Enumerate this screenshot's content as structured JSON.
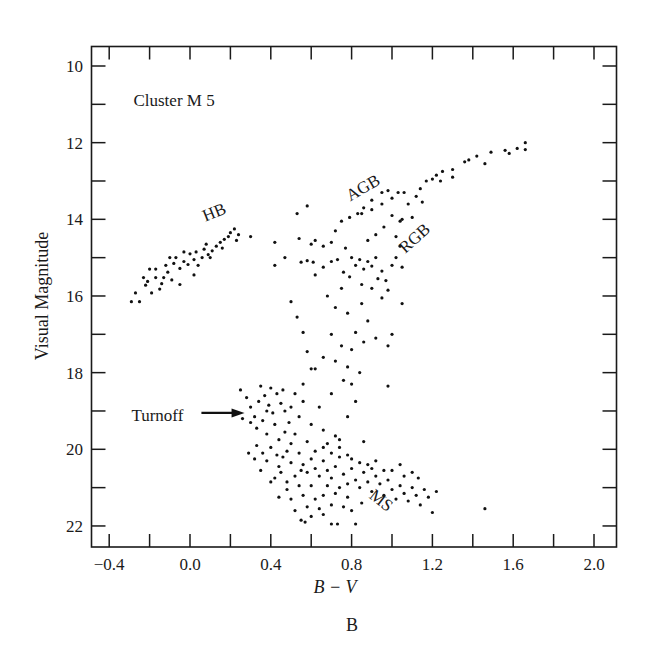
{
  "figure_label": "B",
  "chart_data": {
    "type": "scatter",
    "title": "Cluster M 5",
    "xlabel": "B − V",
    "ylabel": "Visual Magnitude",
    "xlim": [
      -0.48,
      2.11
    ],
    "ylim": [
      22.5,
      9.5
    ],
    "y_inverted": true,
    "grid": false,
    "legend": null,
    "x_ticks": [
      -0.4,
      0.0,
      0.4,
      0.8,
      1.2,
      1.6,
      2.0
    ],
    "x_tick_labels": [
      "−0.4",
      "0.0",
      "0.4",
      "0.8",
      "1.2",
      "1.6",
      "2.0"
    ],
    "x_minor_ticks": [
      -0.2,
      0.2,
      0.6,
      1.0,
      1.4,
      1.8
    ],
    "y_ticks": [
      10,
      12,
      14,
      16,
      18,
      20,
      22
    ],
    "y_tick_labels": [
      "10",
      "12",
      "14",
      "16",
      "18",
      "20",
      "22"
    ],
    "y_minor_ticks": [
      11,
      13,
      15,
      17,
      19,
      21
    ],
    "annotations": [
      {
        "text": "Cluster M 5",
        "bv": -0.28,
        "v": 11.05,
        "rotate": 0
      },
      {
        "text": "HB",
        "bv": 0.13,
        "v": 13.95,
        "rotate": -22
      },
      {
        "text": "AGB",
        "bv": 0.87,
        "v": 13.3,
        "rotate": -30
      },
      {
        "text": "RGB",
        "bv": 1.13,
        "v": 14.6,
        "rotate": -42
      },
      {
        "text": "MS",
        "bv": 0.93,
        "v": 21.45,
        "rotate": 38
      },
      {
        "text": "Turnoff",
        "bv": -0.29,
        "v": 19.25,
        "rotate": 0,
        "arrow_to": {
          "bv": 0.27,
          "v": 19.05
        }
      }
    ],
    "series": [
      {
        "name": "Horizontal Branch (HB)",
        "points": [
          [
            -0.29,
            16.15
          ],
          [
            -0.25,
            16.15
          ],
          [
            -0.27,
            15.92
          ],
          [
            -0.22,
            15.72
          ],
          [
            -0.19,
            15.92
          ],
          [
            -0.21,
            15.62
          ],
          [
            -0.23,
            15.52
          ],
          [
            -0.17,
            15.52
          ],
          [
            -0.15,
            15.82
          ],
          [
            -0.17,
            15.3
          ],
          [
            -0.2,
            15.3
          ],
          [
            -0.13,
            15.52
          ],
          [
            -0.11,
            15.38
          ],
          [
            -0.09,
            15.58
          ],
          [
            -0.12,
            15.2
          ],
          [
            -0.08,
            15.15
          ],
          [
            -0.05,
            15.28
          ],
          [
            -0.07,
            15.0
          ],
          [
            -0.03,
            15.1
          ],
          [
            -0.01,
            15.18
          ],
          [
            0.0,
            14.9
          ],
          [
            0.02,
            15.05
          ],
          [
            0.04,
            15.2
          ],
          [
            0.03,
            14.85
          ],
          [
            -0.03,
            14.85
          ],
          [
            0.06,
            15.0
          ],
          [
            0.07,
            14.78
          ],
          [
            0.09,
            14.92
          ],
          [
            0.11,
            14.82
          ],
          [
            0.13,
            14.7
          ],
          [
            0.15,
            14.6
          ],
          [
            0.17,
            14.52
          ],
          [
            0.19,
            14.45
          ],
          [
            0.2,
            14.35
          ],
          [
            0.22,
            14.25
          ],
          [
            0.24,
            14.4
          ],
          [
            0.23,
            14.55
          ],
          [
            0.1,
            15.0
          ],
          [
            -0.05,
            15.7
          ],
          [
            0.02,
            15.45
          ],
          [
            0.08,
            14.65
          ],
          [
            0.3,
            14.45
          ],
          [
            0.16,
            14.75
          ],
          [
            -0.1,
            15.0
          ],
          [
            -0.14,
            15.68
          ]
        ]
      },
      {
        "name": "Red Giant Branch (RGB)",
        "points": [
          [
            0.55,
            15.12
          ],
          [
            0.58,
            15.08
          ],
          [
            0.61,
            15.12
          ],
          [
            0.6,
            14.65
          ],
          [
            0.62,
            15.45
          ],
          [
            0.66,
            15.25
          ],
          [
            0.7,
            15.1
          ],
          [
            0.73,
            15.05
          ],
          [
            0.76,
            15.38
          ],
          [
            0.79,
            15.5
          ],
          [
            0.8,
            15.0
          ],
          [
            0.82,
            15.2
          ],
          [
            0.84,
            15.05
          ],
          [
            0.86,
            15.3
          ],
          [
            0.88,
            15.1
          ],
          [
            0.9,
            15.22
          ],
          [
            0.92,
            15.0
          ],
          [
            0.95,
            15.35
          ],
          [
            0.93,
            15.55
          ],
          [
            0.97,
            15.6
          ],
          [
            1.0,
            15.2
          ],
          [
            1.02,
            15.0
          ],
          [
            1.04,
            14.7
          ],
          [
            1.05,
            15.25
          ],
          [
            0.85,
            15.7
          ],
          [
            0.9,
            15.8
          ],
          [
            0.98,
            15.85
          ],
          [
            1.05,
            16.2
          ],
          [
            0.75,
            15.8
          ],
          [
            0.68,
            16.0
          ],
          [
            0.72,
            16.3
          ],
          [
            0.78,
            16.45
          ],
          [
            0.85,
            16.2
          ],
          [
            0.95,
            16.05
          ],
          [
            0.88,
            16.65
          ],
          [
            0.82,
            16.95
          ],
          [
            0.92,
            17.1
          ],
          [
            0.98,
            17.3
          ],
          [
            1.0,
            17.0
          ],
          [
            0.7,
            17.0
          ],
          [
            0.75,
            17.3
          ],
          [
            0.8,
            17.4
          ],
          [
            0.86,
            17.2
          ],
          [
            0.66,
            17.6
          ],
          [
            0.72,
            17.7
          ],
          [
            0.62,
            17.9
          ],
          [
            0.78,
            17.85
          ],
          [
            0.84,
            18.0
          ],
          [
            0.98,
            18.35
          ],
          [
            0.8,
            18.3
          ],
          [
            0.85,
            13.85
          ],
          [
            0.9,
            13.75
          ],
          [
            0.95,
            13.6
          ],
          [
            1.0,
            13.45
          ],
          [
            1.03,
            13.3
          ],
          [
            1.06,
            13.3
          ],
          [
            1.0,
            13.9
          ],
          [
            1.05,
            14.0
          ],
          [
            1.08,
            13.6
          ],
          [
            1.12,
            13.4
          ],
          [
            1.14,
            13.2
          ],
          [
            1.17,
            13.0
          ],
          [
            1.2,
            12.95
          ],
          [
            1.22,
            12.85
          ],
          [
            1.25,
            12.75
          ],
          [
            1.3,
            12.7
          ],
          [
            1.36,
            12.5
          ],
          [
            1.42,
            12.35
          ],
          [
            1.49,
            12.25
          ],
          [
            1.56,
            12.2
          ],
          [
            1.62,
            12.15
          ],
          [
            1.66,
            12.0
          ],
          [
            1.66,
            12.18
          ],
          [
            1.58,
            12.28
          ],
          [
            1.46,
            12.55
          ],
          [
            1.38,
            12.45
          ],
          [
            1.3,
            12.9
          ],
          [
            1.24,
            13.0
          ],
          [
            1.15,
            13.55
          ],
          [
            1.1,
            13.95
          ],
          [
            1.04,
            14.05
          ],
          [
            0.96,
            14.2
          ],
          [
            0.92,
            14.4
          ],
          [
            0.88,
            14.55
          ],
          [
            1.02,
            14.45
          ]
        ]
      },
      {
        "name": "Asymptotic Giant Branch (AGB)",
        "points": [
          [
            0.58,
            13.65
          ],
          [
            0.72,
            14.3
          ],
          [
            0.75,
            14.05
          ],
          [
            0.79,
            13.95
          ],
          [
            0.83,
            13.85
          ],
          [
            0.86,
            13.7
          ],
          [
            0.9,
            13.5
          ],
          [
            0.95,
            13.3
          ],
          [
            0.98,
            13.25
          ],
          [
            0.62,
            14.55
          ],
          [
            0.66,
            14.7
          ],
          [
            0.7,
            14.6
          ],
          [
            0.77,
            14.75
          ],
          [
            0.53,
            13.85
          ],
          [
            0.54,
            14.5
          ],
          [
            0.42,
            14.6
          ],
          [
            0.47,
            15.0
          ],
          [
            0.42,
            15.2
          ]
        ]
      },
      {
        "name": "Subgiant / Turnoff region",
        "points": [
          [
            0.5,
            16.15
          ],
          [
            0.53,
            16.55
          ],
          [
            0.56,
            16.95
          ],
          [
            0.58,
            17.45
          ],
          [
            0.6,
            17.9
          ],
          [
            0.56,
            18.3
          ],
          [
            0.52,
            18.55
          ],
          [
            0.5,
            18.9
          ],
          [
            0.54,
            19.15
          ],
          [
            0.6,
            19.35
          ],
          [
            0.66,
            19.5
          ],
          [
            0.72,
            19.65
          ],
          [
            0.64,
            18.9
          ],
          [
            0.7,
            18.55
          ],
          [
            0.76,
            18.2
          ],
          [
            0.82,
            18.75
          ],
          [
            0.78,
            19.15
          ],
          [
            0.68,
            19.85
          ],
          [
            0.74,
            19.95
          ]
        ]
      },
      {
        "name": "Turnoff / Main Sequence (MS)",
        "points": [
          [
            0.25,
            18.45
          ],
          [
            0.28,
            18.65
          ],
          [
            0.3,
            18.9
          ],
          [
            0.32,
            19.15
          ],
          [
            0.35,
            18.35
          ],
          [
            0.37,
            18.6
          ],
          [
            0.39,
            18.85
          ],
          [
            0.41,
            19.05
          ],
          [
            0.4,
            18.4
          ],
          [
            0.43,
            18.55
          ],
          [
            0.45,
            18.8
          ],
          [
            0.47,
            19.0
          ],
          [
            0.3,
            19.3
          ],
          [
            0.33,
            19.45
          ],
          [
            0.36,
            19.25
          ],
          [
            0.38,
            19.6
          ],
          [
            0.42,
            19.35
          ],
          [
            0.44,
            19.75
          ],
          [
            0.47,
            19.55
          ],
          [
            0.49,
            19.3
          ],
          [
            0.5,
            19.85
          ],
          [
            0.52,
            19.6
          ],
          [
            0.33,
            19.9
          ],
          [
            0.36,
            20.1
          ],
          [
            0.4,
            19.95
          ],
          [
            0.43,
            20.15
          ],
          [
            0.46,
            20.2
          ],
          [
            0.48,
            20.05
          ],
          [
            0.32,
            20.25
          ],
          [
            0.38,
            20.3
          ],
          [
            0.44,
            20.45
          ],
          [
            0.5,
            20.35
          ],
          [
            0.54,
            20.1
          ],
          [
            0.56,
            20.4
          ],
          [
            0.58,
            20.6
          ],
          [
            0.6,
            20.25
          ],
          [
            0.62,
            20.5
          ],
          [
            0.64,
            20.7
          ],
          [
            0.66,
            20.3
          ],
          [
            0.68,
            20.55
          ],
          [
            0.7,
            20.75
          ],
          [
            0.72,
            20.45
          ],
          [
            0.74,
            20.2
          ],
          [
            0.76,
            20.65
          ],
          [
            0.78,
            20.9
          ],
          [
            0.8,
            20.5
          ],
          [
            0.82,
            20.8
          ],
          [
            0.84,
            21.0
          ],
          [
            0.86,
            20.6
          ],
          [
            0.88,
            20.85
          ],
          [
            0.9,
            21.1
          ],
          [
            0.92,
            20.7
          ],
          [
            0.94,
            20.9
          ],
          [
            0.96,
            21.2
          ],
          [
            0.98,
            20.8
          ],
          [
            1.0,
            21.05
          ],
          [
            1.02,
            21.3
          ],
          [
            1.04,
            20.95
          ],
          [
            1.06,
            21.15
          ],
          [
            1.08,
            21.35
          ],
          [
            1.1,
            21.0
          ],
          [
            1.12,
            21.2
          ],
          [
            1.14,
            21.45
          ],
          [
            1.16,
            21.05
          ],
          [
            1.18,
            21.25
          ],
          [
            1.2,
            21.65
          ],
          [
            1.22,
            21.1
          ],
          [
            1.1,
            20.6
          ],
          [
            1.13,
            20.75
          ],
          [
            1.06,
            20.7
          ],
          [
            0.52,
            20.7
          ],
          [
            0.54,
            20.95
          ],
          [
            0.56,
            21.2
          ],
          [
            0.58,
            21.5
          ],
          [
            0.6,
            21.75
          ],
          [
            0.62,
            21.3
          ],
          [
            0.64,
            21.55
          ],
          [
            0.5,
            21.3
          ],
          [
            0.52,
            21.6
          ],
          [
            0.55,
            21.85
          ],
          [
            0.57,
            21.9
          ],
          [
            0.66,
            21.2
          ],
          [
            0.7,
            21.45
          ],
          [
            0.74,
            21.0
          ],
          [
            0.78,
            21.25
          ],
          [
            0.8,
            21.6
          ],
          [
            0.85,
            21.4
          ],
          [
            0.45,
            20.6
          ],
          [
            0.48,
            20.85
          ],
          [
            0.42,
            20.75
          ],
          [
            0.55,
            20.55
          ],
          [
            0.6,
            20.95
          ],
          [
            0.68,
            20.95
          ],
          [
            0.72,
            21.15
          ],
          [
            0.76,
            21.5
          ],
          [
            0.62,
            20.05
          ],
          [
            0.66,
            19.95
          ],
          [
            0.7,
            20.1
          ],
          [
            0.74,
            19.75
          ],
          [
            0.78,
            20.15
          ],
          [
            0.8,
            20.25
          ],
          [
            0.84,
            20.35
          ],
          [
            0.86,
            19.8
          ],
          [
            0.88,
            20.4
          ],
          [
            0.9,
            20.5
          ],
          [
            0.92,
            20.3
          ],
          [
            1.0,
            20.55
          ],
          [
            1.04,
            20.4
          ],
          [
            0.96,
            20.55
          ],
          [
            0.73,
            21.95
          ],
          [
            1.46,
            21.55
          ],
          [
            0.34,
            18.75
          ],
          [
            0.38,
            19.0
          ],
          [
            0.46,
            18.45
          ],
          [
            0.56,
            18.75
          ],
          [
            0.58,
            19.8
          ],
          [
            0.29,
            20.1
          ],
          [
            0.26,
            19.2
          ],
          [
            0.35,
            20.55
          ],
          [
            0.4,
            20.85
          ],
          [
            0.48,
            21.05
          ],
          [
            0.44,
            21.25
          ],
          [
            0.66,
            21.7
          ],
          [
            0.7,
            21.95
          ],
          [
            0.82,
            21.95
          ]
        ]
      }
    ]
  }
}
